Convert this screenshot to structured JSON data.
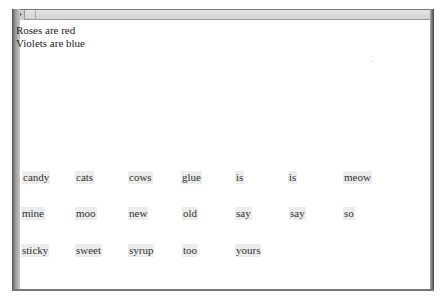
{
  "window": {
    "menu_glyph": "▾"
  },
  "poem": {
    "lines": [
      "Roses are red",
      "Violets are blue"
    ]
  },
  "words": [
    [
      "candy",
      "cats",
      "cows",
      "glue",
      "is",
      "is",
      "meow"
    ],
    [
      "mine",
      "moo",
      "new",
      "old",
      "say",
      "say",
      "so"
    ],
    [
      "sticky",
      "sweet",
      "syrup",
      "too",
      "yours"
    ]
  ]
}
